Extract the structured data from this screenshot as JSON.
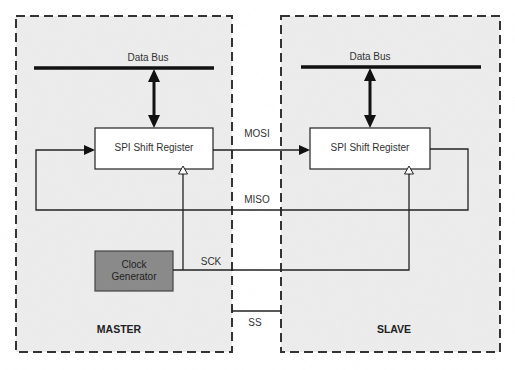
{
  "diagram": {
    "master": {
      "label": "MASTER",
      "data_bus_label": "Data Bus",
      "shift_register_label": "SPI Shift Register",
      "clock_generator_label": "Clock\nGenerator",
      "clock_line1": "Clock",
      "clock_line2": "Generator"
    },
    "slave": {
      "label": "SLAVE",
      "data_bus_label": "Data Bus",
      "shift_register_label": "SPI Shift Register"
    },
    "signals": {
      "mosi": "MOSI",
      "miso": "MISO",
      "sck": "SCK",
      "ss": "SS"
    },
    "colors": {
      "panel_fill": "#ececec",
      "border_dash": "#333333",
      "register_fill": "#ffffff",
      "clock_fill": "#8a8a8a",
      "line": "#222222"
    },
    "nodes": [
      {
        "id": "master_bus",
        "label": "Data Bus"
      },
      {
        "id": "master_reg",
        "label": "SPI Shift Register"
      },
      {
        "id": "clock_gen",
        "label": "Clock Generator"
      },
      {
        "id": "slave_bus",
        "label": "Data Bus"
      },
      {
        "id": "slave_reg",
        "label": "SPI Shift Register"
      }
    ],
    "edges": [
      {
        "from": "master_bus",
        "to": "master_reg",
        "type": "bidirectional"
      },
      {
        "from": "slave_bus",
        "to": "slave_reg",
        "type": "bidirectional"
      },
      {
        "from": "master_reg",
        "to": "slave_reg",
        "label": "MOSI"
      },
      {
        "from": "slave_reg",
        "to": "master_reg",
        "label": "MISO"
      },
      {
        "from": "clock_gen",
        "to": "master_reg",
        "label": "SCK"
      },
      {
        "from": "clock_gen",
        "to": "slave_reg",
        "label": "SCK"
      },
      {
        "from": "master",
        "to": "slave",
        "label": "SS"
      }
    ]
  }
}
